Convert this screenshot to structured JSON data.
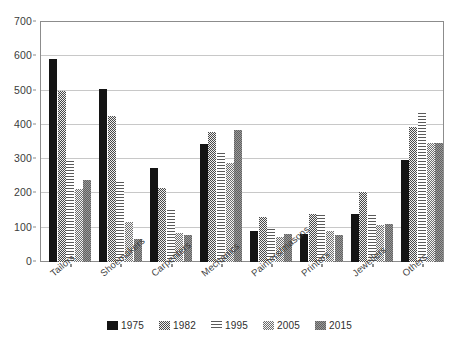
{
  "chart_data": {
    "type": "bar",
    "title": "",
    "xlabel": "",
    "ylabel": "",
    "ylim": [
      0,
      700
    ],
    "ytick_step": 100,
    "yticks": [
      0,
      100,
      200,
      300,
      400,
      500,
      600,
      700
    ],
    "grid": true,
    "legend_position": "bottom",
    "categories": [
      "Tailors",
      "Shoemakers",
      "Carpenters",
      "Mechanics",
      "Painters/masons",
      "Printers",
      "Jewellers",
      "Others"
    ],
    "series": [
      {
        "name": "1975",
        "pattern": "solid-black",
        "color": "#141414",
        "values": [
          593,
          505,
          274,
          345,
          91,
          82,
          140,
          299
        ]
      },
      {
        "name": "1982",
        "pattern": "dense-speckle",
        "color": "#8a8a8a",
        "values": [
          500,
          425,
          217,
          379,
          132,
          141,
          205,
          395
        ]
      },
      {
        "name": "1995",
        "pattern": "horizontal-lines",
        "color": "#9b9b9b",
        "values": [
          294,
          234,
          152,
          318,
          95,
          137,
          138,
          436
        ]
      },
      {
        "name": "2005",
        "pattern": "grey-checker",
        "color": "#9d9d9d",
        "values": [
          214,
          117,
          85,
          288,
          73,
          91,
          109,
          347
        ]
      },
      {
        "name": "2015",
        "pattern": "dark-checker",
        "color": "#1c1c1c",
        "values": [
          240,
          68,
          78,
          384,
          82,
          78,
          111,
          347
        ]
      }
    ]
  },
  "legend": {
    "items": [
      {
        "label": "1975"
      },
      {
        "label": "1982"
      },
      {
        "label": "1995"
      },
      {
        "label": "2005"
      },
      {
        "label": "2015"
      }
    ]
  }
}
